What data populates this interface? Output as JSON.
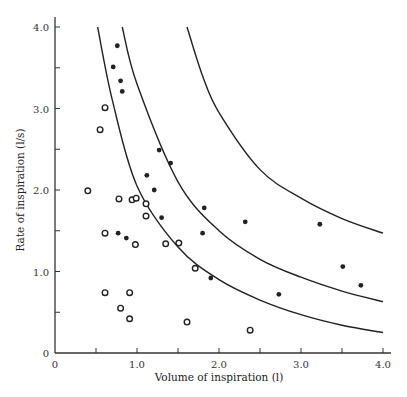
{
  "chart_data": {
    "type": "scatter",
    "title": "",
    "xlabel": "Volume of inspiration (l)",
    "ylabel": "Rate of inspiration (l/s)",
    "xlim": [
      0,
      4.0
    ],
    "ylim": [
      0,
      4.0
    ],
    "grid": false,
    "legend": null,
    "x_ticks": [
      0,
      0.5,
      1.0,
      1.5,
      2.0,
      2.5,
      3.0,
      3.5,
      4.0
    ],
    "x_tick_labels": [
      "0",
      "",
      "1.0",
      "",
      "2.0",
      "",
      "3.0",
      "",
      "4.0"
    ],
    "y_ticks": [
      0,
      0.5,
      1.0,
      1.5,
      2.0,
      2.5,
      3.0,
      3.5,
      4.0
    ],
    "y_tick_labels": [
      "0",
      "",
      "1.0",
      "",
      "2.0",
      "",
      "3.0",
      "",
      "4.0"
    ],
    "series": [
      {
        "name": "filled circles",
        "marker": "filled-circle",
        "points": [
          [
            0.76,
            3.77
          ],
          [
            0.71,
            3.51
          ],
          [
            0.8,
            3.34
          ],
          [
            0.82,
            3.21
          ],
          [
            1.27,
            2.49
          ],
          [
            1.41,
            2.33
          ],
          [
            1.12,
            2.18
          ],
          [
            1.21,
            2.0
          ],
          [
            1.3,
            1.66
          ],
          [
            1.82,
            1.78
          ],
          [
            1.8,
            1.47
          ],
          [
            2.32,
            1.61
          ],
          [
            0.77,
            1.47
          ],
          [
            0.87,
            1.41
          ],
          [
            1.9,
            0.92
          ],
          [
            2.73,
            0.72
          ],
          [
            3.23,
            1.58
          ],
          [
            3.51,
            1.06
          ],
          [
            3.73,
            0.83
          ]
        ]
      },
      {
        "name": "open circles",
        "marker": "open-circle",
        "points": [
          [
            0.61,
            3.01
          ],
          [
            0.55,
            2.74
          ],
          [
            0.4,
            1.99
          ],
          [
            0.78,
            1.89
          ],
          [
            0.94,
            1.88
          ],
          [
            0.99,
            1.9
          ],
          [
            1.11,
            1.83
          ],
          [
            1.11,
            1.68
          ],
          [
            0.61,
            1.47
          ],
          [
            0.98,
            1.33
          ],
          [
            1.35,
            1.34
          ],
          [
            1.51,
            1.35
          ],
          [
            1.71,
            1.04
          ],
          [
            0.61,
            0.74
          ],
          [
            0.91,
            0.74
          ],
          [
            0.8,
            0.55
          ],
          [
            0.91,
            0.42
          ],
          [
            1.61,
            0.38
          ],
          [
            2.38,
            0.28
          ]
        ]
      }
    ],
    "curves": [
      {
        "name": "inner boundary curve",
        "points": [
          [
            0.52,
            4.0
          ],
          [
            0.7,
            3.1
          ],
          [
            1.0,
            2.05
          ],
          [
            1.5,
            1.3
          ],
          [
            2.0,
            0.9
          ],
          [
            2.5,
            0.65
          ],
          [
            3.0,
            0.47
          ],
          [
            3.5,
            0.34
          ],
          [
            4.0,
            0.25
          ]
        ]
      },
      {
        "name": "middle boundary curve",
        "points": [
          [
            0.82,
            4.0
          ],
          [
            1.0,
            3.3
          ],
          [
            1.5,
            2.1
          ],
          [
            2.0,
            1.5
          ],
          [
            2.5,
            1.15
          ],
          [
            3.0,
            0.93
          ],
          [
            3.5,
            0.76
          ],
          [
            4.0,
            0.63
          ]
        ]
      },
      {
        "name": "outer boundary curve",
        "points": [
          [
            1.61,
            4.0
          ],
          [
            1.8,
            3.4
          ],
          [
            2.0,
            2.95
          ],
          [
            2.5,
            2.25
          ],
          [
            3.0,
            1.9
          ],
          [
            3.5,
            1.65
          ],
          [
            4.0,
            1.47
          ]
        ]
      }
    ]
  }
}
